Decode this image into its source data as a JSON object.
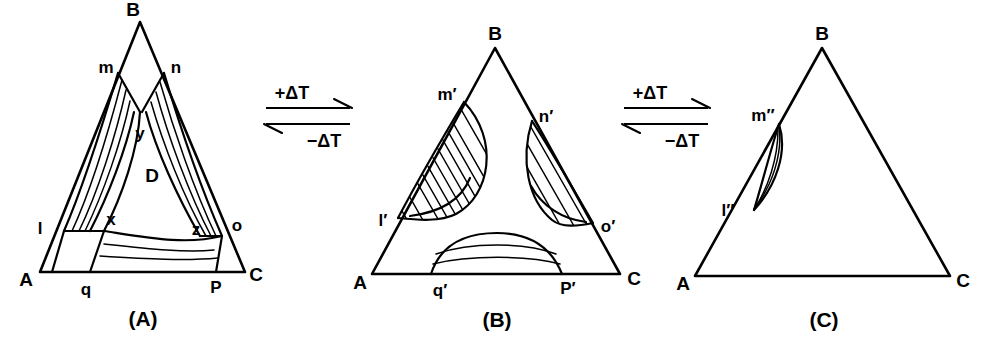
{
  "figure": {
    "panels": [
      {
        "id": "A",
        "caption": "(A)",
        "vertices": [
          {
            "name": "A",
            "label": "A"
          },
          {
            "name": "B",
            "label": "B"
          },
          {
            "name": "C",
            "label": "C"
          }
        ],
        "points": [
          {
            "name": "m",
            "label": "m"
          },
          {
            "name": "n",
            "label": "n"
          },
          {
            "name": "y",
            "label": "y"
          },
          {
            "name": "l",
            "label": "l"
          },
          {
            "name": "x",
            "label": "x"
          },
          {
            "name": "z",
            "label": "z"
          },
          {
            "name": "o",
            "label": "o"
          },
          {
            "name": "q",
            "label": "q"
          },
          {
            "name": "P",
            "label": "P"
          }
        ],
        "regions": [
          {
            "name": "D",
            "label": "D"
          }
        ]
      },
      {
        "id": "B",
        "caption": "(B)",
        "vertices": [
          {
            "name": "A",
            "label": "A"
          },
          {
            "name": "B",
            "label": "B"
          },
          {
            "name": "C",
            "label": "C"
          }
        ],
        "points": [
          {
            "name": "m-prime",
            "label": "m′"
          },
          {
            "name": "n-prime",
            "label": "n′"
          },
          {
            "name": "l-prime",
            "label": "l′"
          },
          {
            "name": "o-prime",
            "label": "o′"
          },
          {
            "name": "q-prime",
            "label": "q′"
          },
          {
            "name": "P-prime",
            "label": "P′"
          }
        ],
        "regions": []
      },
      {
        "id": "C",
        "caption": "(C)",
        "vertices": [
          {
            "name": "A",
            "label": "A"
          },
          {
            "name": "B",
            "label": "B"
          },
          {
            "name": "C",
            "label": "C"
          }
        ],
        "points": [
          {
            "name": "m-double-prime",
            "label": "m″"
          },
          {
            "name": "l-double-prime",
            "label": "l″"
          }
        ],
        "regions": []
      }
    ],
    "transitions": [
      {
        "name": "transition-a-to-b",
        "forward_label": "+ΔT",
        "reverse_label": "−ΔT"
      },
      {
        "name": "transition-b-to-c",
        "forward_label": "+ΔT",
        "reverse_label": "−ΔT"
      }
    ],
    "colors": {
      "ink": "#000000",
      "background": "#ffffff"
    }
  }
}
